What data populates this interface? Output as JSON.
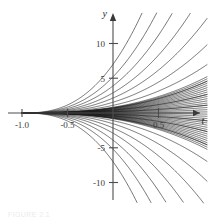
{
  "figure": {
    "caption": "FIGURE 2.1",
    "background_color": "#ffffff",
    "curve_color": "#1d1d1d",
    "axis_color": "#4d4d4d"
  },
  "chart_data": {
    "type": "line",
    "title": "",
    "subtitle": "",
    "xlabel": "t",
    "ylabel": "y",
    "grid": false,
    "legend": null,
    "xlim": [
      -1.2,
      0.92
    ],
    "ylim": [
      -14,
      14
    ],
    "xticks": [
      -1.0,
      -0.5,
      0.5
    ],
    "xtick_labels": [
      "-1.0",
      "-0.5",
      "0.5"
    ],
    "yticks": [
      10,
      5,
      -5,
      -10
    ],
    "ytick_labels": [
      "10",
      "5",
      "-5",
      "-10"
    ],
    "axis_origin": [
      0,
      0
    ],
    "series": [
      {
        "name": "c = 7.0",
        "c": 7.0
      },
      {
        "name": "c = 5.2",
        "c": 5.2
      },
      {
        "name": "c = 3.9",
        "c": 3.9
      },
      {
        "name": "c = 2.9",
        "c": 2.9
      },
      {
        "name": "c = 2.15",
        "c": 2.15
      },
      {
        "name": "c = 1.55",
        "c": 1.55
      },
      {
        "name": "c = 1.1",
        "c": 1.1
      },
      {
        "name": "c = 0.72",
        "c": 0.72
      },
      {
        "name": "c = 0.42",
        "c": 0.42
      },
      {
        "name": "c = 0.18",
        "c": 0.18
      },
      {
        "name": "c = -0.18",
        "c": -0.18
      },
      {
        "name": "c = -0.42",
        "c": -0.42
      },
      {
        "name": "c = -0.72",
        "c": -0.72
      },
      {
        "name": "c = -1.1",
        "c": -1.1
      },
      {
        "name": "c = -1.55",
        "c": -1.55
      },
      {
        "name": "c = -2.15",
        "c": -2.15
      },
      {
        "name": "c = -2.9",
        "c": -2.9
      },
      {
        "name": "c = -3.9",
        "c": -3.9
      },
      {
        "name": "c = -5.2",
        "c": -5.2
      },
      {
        "name": "c = -7.0",
        "c": -7.0
      }
    ]
  },
  "axes": {
    "y_axis_name": "y",
    "t_axis_name": "t",
    "y_ticks": [
      {
        "value": 10,
        "label": "10"
      },
      {
        "value": 5,
        "label": "5"
      },
      {
        "value": -5,
        "label": "-5"
      },
      {
        "value": -10,
        "label": "-10"
      }
    ],
    "x_ticks": [
      {
        "value": -1.0,
        "label": "-1.0"
      },
      {
        "value": -0.5,
        "label": "-0.5"
      },
      {
        "value": 0.5,
        "label": "0.5"
      }
    ]
  }
}
